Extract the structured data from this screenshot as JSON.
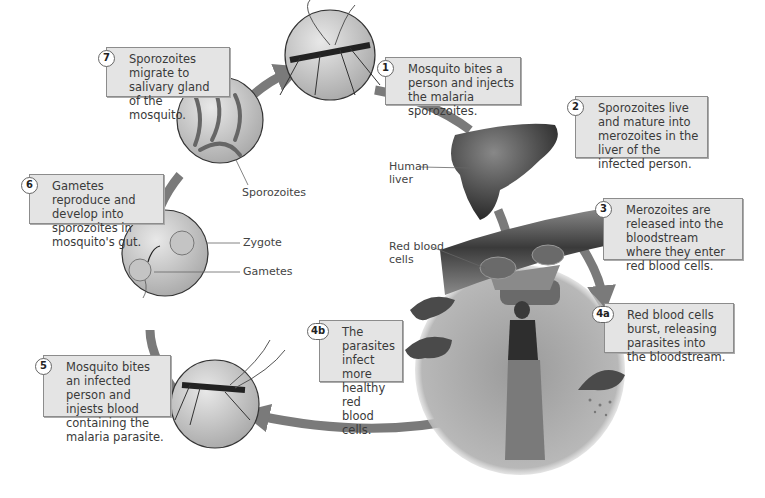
{
  "figure": {
    "steps": [
      {
        "id": "1",
        "text": "Mosquito bites a person and injects the malaria sporozoites."
      },
      {
        "id": "2",
        "text": "Sporozoites live and mature into merozoites in the liver of the infected person."
      },
      {
        "id": "3",
        "text": "Merozoites are released into the bloodstream where they enter red blood cells."
      },
      {
        "id": "4a",
        "text": "Red blood cells burst, releasing parasites into the bloodstream."
      },
      {
        "id": "4b",
        "text": "The parasites infect more healthy red blood cells."
      },
      {
        "id": "5",
        "text": "Mosquito bites an infected person and injests blood containing the malaria parasite."
      },
      {
        "id": "6",
        "text": "Gametes reproduce and develop into sporozoites in mosquito's gut."
      },
      {
        "id": "7",
        "text": "Sporozoites migrate to salivary gland of the mosquito."
      }
    ],
    "labels": {
      "human_liver": "Human liver",
      "red_blood_cells": "Red blood cells",
      "sporozoites": "Sporozoites",
      "zygote": "Zygote",
      "gametes": "Gametes"
    },
    "colors": {
      "arrow": "#7a7a7a",
      "box_fill": "#e4e4e4",
      "box_border": "#8c8c8c",
      "liver": "#3c3c3c",
      "rbc": "#5a5a5a"
    }
  }
}
